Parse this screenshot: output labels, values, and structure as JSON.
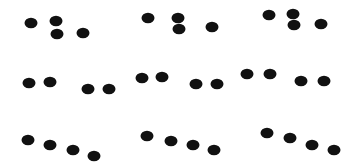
{
  "figure": {
    "background": "#ffffff",
    "dot_color": "#111111",
    "dot_rx": 6.5,
    "dot_ry": 5.2,
    "panels": [
      {
        "row": 1,
        "col": 1,
        "dots": [
          [
            31,
            23
          ],
          [
            56,
            21
          ],
          [
            57,
            34
          ],
          [
            83,
            33
          ]
        ]
      },
      {
        "row": 1,
        "col": 2,
        "dots": [
          [
            148,
            18
          ],
          [
            178,
            18
          ],
          [
            179,
            29
          ],
          [
            212,
            27
          ]
        ]
      },
      {
        "row": 1,
        "col": 3,
        "dots": [
          [
            269,
            15
          ],
          [
            293,
            14
          ],
          [
            294,
            25
          ],
          [
            321,
            24
          ]
        ]
      },
      {
        "row": 2,
        "col": 1,
        "dots": [
          [
            29,
            83
          ],
          [
            50,
            82
          ],
          [
            88,
            89
          ],
          [
            109,
            89
          ]
        ]
      },
      {
        "row": 2,
        "col": 2,
        "dots": [
          [
            142,
            78
          ],
          [
            162,
            77
          ],
          [
            196,
            84
          ],
          [
            217,
            84
          ]
        ]
      },
      {
        "row": 2,
        "col": 3,
        "dots": [
          [
            247,
            74
          ],
          [
            270,
            74
          ],
          [
            301,
            81
          ],
          [
            324,
            81
          ]
        ]
      },
      {
        "row": 3,
        "col": 1,
        "dots": [
          [
            28,
            140
          ],
          [
            50,
            145
          ],
          [
            73,
            150
          ],
          [
            94,
            156
          ]
        ]
      },
      {
        "row": 3,
        "col": 2,
        "dots": [
          [
            147,
            136
          ],
          [
            171,
            141
          ],
          [
            193,
            145
          ],
          [
            214,
            150
          ]
        ]
      },
      {
        "row": 3,
        "col": 3,
        "dots": [
          [
            267,
            133
          ],
          [
            290,
            138
          ],
          [
            312,
            145
          ],
          [
            334,
            150
          ]
        ]
      }
    ]
  }
}
